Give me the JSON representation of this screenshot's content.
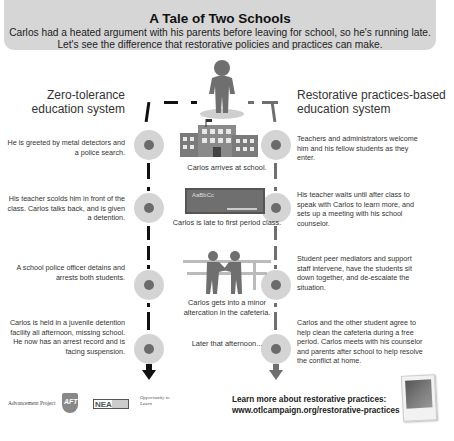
{
  "header": {
    "title": "A Tale of Two Schools",
    "subtitle": "Carlos had a heated argument with his parents before leaving for school, so he's running late. Let's see the difference that restorative policies and practices can make."
  },
  "columns": {
    "left_title": "Zero-tolerance education system",
    "right_title": "Restorative practices-based education system"
  },
  "timeline": [
    {
      "event": "Carlos arrives at school.",
      "icon": "school-building-icon",
      "zero_tolerance": "He is greeted by metal detectors and a police search.",
      "restorative": "Teachers and administrators welcome him and his fellow students as they enter."
    },
    {
      "event": "Carlos is late to first period class.",
      "icon": "chalkboard-icon",
      "chalkboard_text": "AaBbCc",
      "zero_tolerance": "His teacher scolds him in front of the class. Carlos talks back, and is given a detention.",
      "restorative": "His teacher waits until after class to speak with Carlos to learn more, and sets up a meeting with his school counselor."
    },
    {
      "event": "Carlos gets into a minor altercation in the cafeteria.",
      "icon": "altercation-icon",
      "zero_tolerance": "A school police officer detains and arrests both students.",
      "restorative": "Student peer mediators and support staff intervene, have the students sit down together, and de-escalate the situation."
    },
    {
      "event": "Later that afternoon...",
      "icon": "",
      "zero_tolerance": "Carlos is held in a juvenile detention facility all afternoon, missing school. He now has an arrest record and is facing suspension.",
      "restorative": "Carlos and the other student agree to help clean the cafeteria during a free period. Carlos meets with his counselor and parents after school to help resolve the conflict at home."
    }
  ],
  "footer": {
    "learn_more": "Learn more about restorative practices:",
    "url": "www.otlcampaign.org/restorative-practices",
    "logos": [
      "Advancement Project",
      "AFT",
      "NEA",
      "Opportunity to Learn"
    ]
  },
  "colors": {
    "zero_tolerance_path": "#111111",
    "restorative_path": "#6f6f6f",
    "header_bg": "#d6d6d6",
    "node_outer": "#d4d4d4",
    "node_inner": "#6b6b6b"
  }
}
